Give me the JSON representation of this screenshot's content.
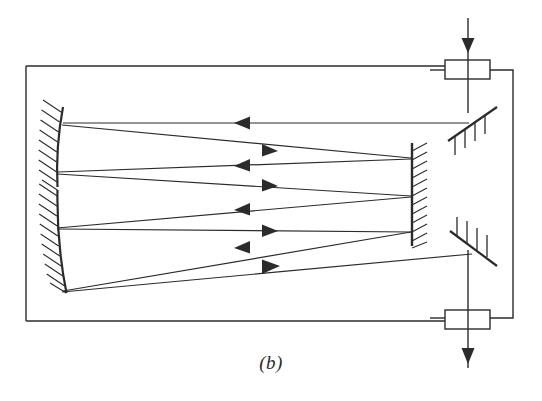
{
  "figure": {
    "caption": "(b)",
    "stroke_color": "#2b2b2b",
    "background_color": "#ffffff",
    "line_width": 1.4
  },
  "enclosure": {
    "label": "cell-enclosure",
    "x": 26,
    "y": 66,
    "width": 487,
    "height": 255
  },
  "windows": [
    {
      "name": "top-window",
      "x": 445,
      "y": 60,
      "width": 45,
      "height": 19
    },
    {
      "name": "bottom-window",
      "x": 445,
      "y": 310,
      "width": 45,
      "height": 19
    }
  ],
  "beams": {
    "input": {
      "name": "input-beam",
      "x": 468,
      "y_start": 18,
      "y_end": 113,
      "arrow_y": 45,
      "direction": "down"
    },
    "output": {
      "name": "output-beam",
      "x": 468,
      "y_start": 255,
      "y_end": 365,
      "arrow_y": 360,
      "direction": "down"
    }
  },
  "mirrors": {
    "left_upper": {
      "name": "left-upper-concave-mirror",
      "x1": 63,
      "y1": 108,
      "x2": 57,
      "y2": 187,
      "hatch_side": "left"
    },
    "left_lower": {
      "name": "left-lower-concave-mirror",
      "x1": 57,
      "y1": 190,
      "x2": 66,
      "y2": 292,
      "hatch_side": "left"
    },
    "right_flat": {
      "name": "right-flat-mirror",
      "x1": 412,
      "y1": 143,
      "x2": 412,
      "y2": 246,
      "hatch_side": "right"
    },
    "steering_top": {
      "name": "top-steering-mirror",
      "x1": 450,
      "y1": 140,
      "x2": 496,
      "y2": 108,
      "hatch_side": "above"
    },
    "steering_bottom": {
      "name": "bottom-steering-mirror",
      "x1": 452,
      "y1": 232,
      "x2": 496,
      "y2": 265,
      "hatch_side": "above"
    }
  },
  "rays": [
    {
      "name": "ray-1-in",
      "from_x": 468,
      "from_y": 123,
      "to_x": 63,
      "to_y": 123,
      "arrow_x": 243,
      "arrow_dir": "left"
    },
    {
      "name": "ray-2-out",
      "from_x": 63,
      "from_y": 124,
      "to_x": 410,
      "to_y": 157,
      "arrow_x": 270,
      "arrow_dir": "right"
    },
    {
      "name": "ray-3-in",
      "from_x": 410,
      "from_y": 157,
      "to_x": 58,
      "to_y": 172,
      "arrow_x": 243,
      "arrow_dir": "left"
    },
    {
      "name": "ray-4-out",
      "from_x": 58,
      "from_y": 174,
      "to_x": 410,
      "to_y": 195,
      "arrow_x": 270,
      "arrow_dir": "right"
    },
    {
      "name": "ray-5-in",
      "from_x": 410,
      "from_y": 196,
      "to_x": 58,
      "to_y": 228,
      "arrow_x": 243,
      "arrow_dir": "left"
    },
    {
      "name": "ray-6-out",
      "from_x": 58,
      "from_y": 229,
      "to_x": 410,
      "to_y": 231,
      "arrow_x": 270,
      "arrow_dir": "right"
    },
    {
      "name": "ray-7-in",
      "from_x": 410,
      "from_y": 231,
      "to_x": 63,
      "to_y": 290,
      "arrow_x": 243,
      "arrow_dir": "left"
    },
    {
      "name": "ray-8-out",
      "from_x": 63,
      "from_y": 292,
      "to_x": 470,
      "to_y": 255,
      "arrow_x": 270,
      "arrow_dir": "right"
    }
  ]
}
